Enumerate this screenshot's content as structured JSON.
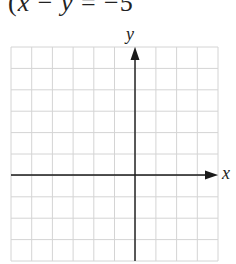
{
  "equation": {
    "open_paren": "(",
    "x": "x",
    "minus": " − ",
    "y": "y",
    "equals": " = −5"
  },
  "graph": {
    "x_axis_label": "x",
    "y_axis_label": "y",
    "grid": {
      "columns": 10,
      "rows": 10,
      "y_axis_column": 6,
      "x_axis_row": 6,
      "line_color": "#d4d4d4",
      "axis_color": "#1a1a1a"
    }
  }
}
